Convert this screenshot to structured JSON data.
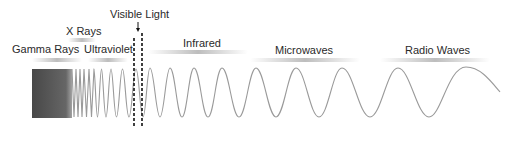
{
  "diagram": {
    "labels": {
      "gamma": "Gamma Rays",
      "xrays": "X Rays",
      "ultraviolet": "Ultraviolet",
      "visible": "Visible Light",
      "infrared": "Infrared",
      "microwaves": "Microwaves",
      "radio": "Radio Waves"
    },
    "colors": {
      "wave": "#9a9a9a",
      "gamma_fill": "#3a3a3a",
      "text": "#2a2a2a",
      "bar": "#bdbdbd",
      "dashed": "#111111"
    }
  }
}
